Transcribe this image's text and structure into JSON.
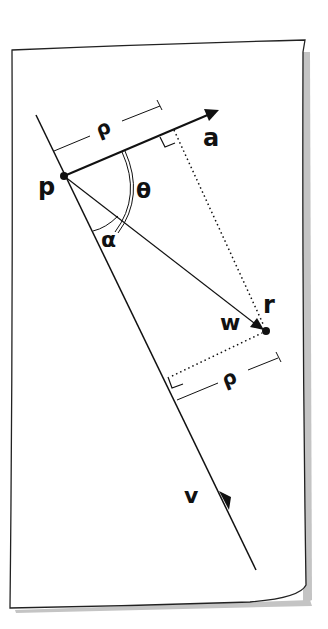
{
  "diagram": {
    "type": "vector-geometry-sketch",
    "labels": {
      "p": "p",
      "r": "r",
      "a": "a",
      "v": "v",
      "w": "w",
      "theta": "θ",
      "alpha": "α",
      "rho_top": "ρ",
      "rho_bottom": "ρ"
    },
    "points": {
      "p": [
        64,
        176
      ],
      "r": [
        266,
        331
      ]
    },
    "vectors": [
      {
        "name": "a",
        "from": "p",
        "to": [
          218,
          110
        ]
      },
      {
        "name": "w",
        "from": "p",
        "to": "r"
      },
      {
        "name": "v",
        "from": [
          36,
          115
        ],
        "to": [
          256,
          570
        ]
      }
    ],
    "colors": {
      "ink": "#111111",
      "shadow": "#b8b8b8",
      "paper": "#ffffff"
    }
  }
}
